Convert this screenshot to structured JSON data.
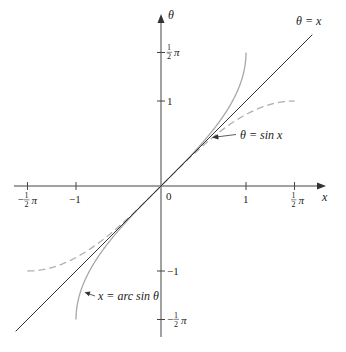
{
  "chart_data": {
    "type": "line",
    "title": "",
    "xlabel": "x",
    "ylabel": "θ",
    "xlim": [
      -1.75,
      1.95
    ],
    "ylim": [
      -1.85,
      2.0
    ],
    "grid": false,
    "legend": "inline annotations",
    "x_ticks": [
      {
        "value": -1.5708,
        "label": "−½π",
        "num": "1",
        "den": "2",
        "sign": "−",
        "suffix": "π"
      },
      {
        "value": -1,
        "label": "−1"
      },
      {
        "value": 0,
        "label": "0"
      },
      {
        "value": 1,
        "label": "1"
      },
      {
        "value": 1.5708,
        "label": "½π",
        "num": "1",
        "den": "2",
        "sign": "",
        "suffix": "π"
      }
    ],
    "y_ticks": [
      {
        "value": 1.5708,
        "label": "½π"
      },
      {
        "value": 1,
        "label": "1"
      },
      {
        "value": -1,
        "label": "−1"
      },
      {
        "value": -1.5708,
        "label": "−½π"
      }
    ],
    "series": [
      {
        "name": "θ = x",
        "style": "solid",
        "color": "#333333",
        "x_range": [
          -1.71,
          1.78
        ],
        "formula": "theta = x"
      },
      {
        "name": "θ = sin x",
        "style": "dashed",
        "color": "#b0b0b0",
        "x_range": [
          -1.5708,
          1.5708
        ],
        "formula": "theta = sin(x)"
      },
      {
        "name": "x = arc sin θ",
        "style": "solid",
        "color": "#a8a8a8",
        "x_range": [
          -1,
          1
        ],
        "formula": "theta = arcsin(x)"
      }
    ],
    "annotations": [
      {
        "text": "θ = x",
        "at": [
          1.62,
          1.92
        ]
      },
      {
        "text": "θ = sin x",
        "at": [
          0.93,
          0.6
        ],
        "arrow_to": [
          0.62,
          0.57
        ]
      },
      {
        "text": "x = arc sin θ",
        "at": [
          -0.74,
          -1.31
        ],
        "arrow_to": [
          -0.88,
          -1.27
        ]
      }
    ]
  },
  "labels": {
    "x_axis": "x",
    "y_axis": "θ",
    "origin": "0",
    "line_label": "θ = x",
    "sin_label": "θ = sin x",
    "arcsin_label": "x = arc sin θ",
    "one": "1",
    "neg_one": "−1",
    "half_num": "1",
    "half_den": "2",
    "pi": "π",
    "minus": "−"
  }
}
